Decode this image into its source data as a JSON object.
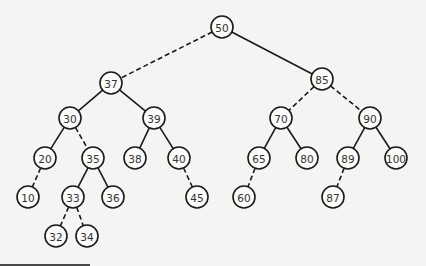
{
  "diagram": {
    "type": "binary-search-tree",
    "nodes": [
      {
        "id": "n50",
        "label": "50",
        "x": 222,
        "y": 27
      },
      {
        "id": "n37",
        "label": "37",
        "x": 111,
        "y": 83
      },
      {
        "id": "n85",
        "label": "85",
        "x": 322,
        "y": 79
      },
      {
        "id": "n30",
        "label": "30",
        "x": 70,
        "y": 118
      },
      {
        "id": "n39",
        "label": "39",
        "x": 154,
        "y": 118
      },
      {
        "id": "n70",
        "label": "70",
        "x": 281,
        "y": 118
      },
      {
        "id": "n90",
        "label": "90",
        "x": 370,
        "y": 118
      },
      {
        "id": "n20",
        "label": "20",
        "x": 45,
        "y": 158
      },
      {
        "id": "n35",
        "label": "35",
        "x": 93,
        "y": 158
      },
      {
        "id": "n38",
        "label": "38",
        "x": 135,
        "y": 158
      },
      {
        "id": "n40",
        "label": "40",
        "x": 179,
        "y": 158
      },
      {
        "id": "n65",
        "label": "65",
        "x": 259,
        "y": 158
      },
      {
        "id": "n80",
        "label": "80",
        "x": 307,
        "y": 158
      },
      {
        "id": "n89",
        "label": "89",
        "x": 348,
        "y": 158
      },
      {
        "id": "n100",
        "label": "100",
        "x": 396,
        "y": 158
      },
      {
        "id": "n10",
        "label": "10",
        "x": 28,
        "y": 197
      },
      {
        "id": "n33",
        "label": "33",
        "x": 73,
        "y": 197
      },
      {
        "id": "n36",
        "label": "36",
        "x": 113,
        "y": 197
      },
      {
        "id": "n45",
        "label": "45",
        "x": 197,
        "y": 197
      },
      {
        "id": "n60",
        "label": "60",
        "x": 244,
        "y": 197
      },
      {
        "id": "n87",
        "label": "87",
        "x": 333,
        "y": 197
      },
      {
        "id": "n32",
        "label": "32",
        "x": 56,
        "y": 236
      },
      {
        "id": "n34",
        "label": "34",
        "x": 87,
        "y": 236
      }
    ],
    "edges": [
      {
        "from": "n50",
        "to": "n37",
        "style": "dashed"
      },
      {
        "from": "n50",
        "to": "n85",
        "style": "solid"
      },
      {
        "from": "n37",
        "to": "n30",
        "style": "solid"
      },
      {
        "from": "n37",
        "to": "n39",
        "style": "solid"
      },
      {
        "from": "n85",
        "to": "n70",
        "style": "dashed"
      },
      {
        "from": "n85",
        "to": "n90",
        "style": "dashed"
      },
      {
        "from": "n30",
        "to": "n20",
        "style": "solid"
      },
      {
        "from": "n30",
        "to": "n35",
        "style": "dashed"
      },
      {
        "from": "n39",
        "to": "n38",
        "style": "solid"
      },
      {
        "from": "n39",
        "to": "n40",
        "style": "solid"
      },
      {
        "from": "n70",
        "to": "n65",
        "style": "solid"
      },
      {
        "from": "n70",
        "to": "n80",
        "style": "solid"
      },
      {
        "from": "n90",
        "to": "n89",
        "style": "solid"
      },
      {
        "from": "n90",
        "to": "n100",
        "style": "solid"
      },
      {
        "from": "n20",
        "to": "n10",
        "style": "dashed"
      },
      {
        "from": "n35",
        "to": "n33",
        "style": "solid"
      },
      {
        "from": "n35",
        "to": "n36",
        "style": "solid"
      },
      {
        "from": "n40",
        "to": "n45",
        "style": "dashed"
      },
      {
        "from": "n65",
        "to": "n60",
        "style": "dashed"
      },
      {
        "from": "n89",
        "to": "n87",
        "style": "dashed"
      },
      {
        "from": "n33",
        "to": "n32",
        "style": "dashed"
      },
      {
        "from": "n33",
        "to": "n34",
        "style": "dashed"
      }
    ],
    "node_radius": 11,
    "colors": {
      "stroke": "#1a1a1a",
      "node_fill": "#fbfbfa",
      "text": "#333333",
      "background": "#f4f4f2"
    }
  }
}
